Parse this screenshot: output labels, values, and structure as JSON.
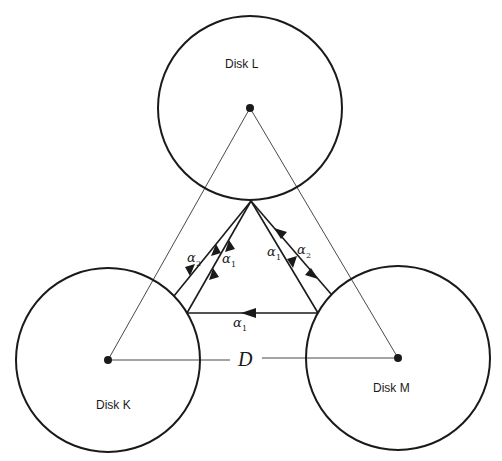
{
  "diagram": {
    "disks": [
      {
        "id": "L",
        "label": "Disk L",
        "cx": 250,
        "cy": 108,
        "r": 92
      },
      {
        "id": "K",
        "label": "Disk K",
        "cx": 108,
        "cy": 360,
        "r": 92
      },
      {
        "id": "M",
        "label": "Disk M",
        "cx": 398,
        "cy": 358,
        "r": 92
      }
    ],
    "distance_label": "D",
    "alpha_symbol": "α",
    "edges": [
      {
        "label": "α1",
        "sub": "1",
        "from": "K",
        "to": "L",
        "position": "inner-left"
      },
      {
        "label": "α2",
        "sub": "2",
        "from": "L",
        "to": "K",
        "position": "outer-left",
        "bidirectional": true
      },
      {
        "label": "α1",
        "sub": "1",
        "from": "L",
        "to": "M",
        "position": "inner-right"
      },
      {
        "label": "α2",
        "sub": "2",
        "from": "M",
        "to": "L",
        "position": "outer-right",
        "bidirectional": true
      },
      {
        "label": "α1",
        "sub": "1",
        "from": "M",
        "to": "K",
        "position": "bottom"
      }
    ],
    "colors": {
      "stroke": "#1a1a1a",
      "background": "#ffffff"
    }
  }
}
